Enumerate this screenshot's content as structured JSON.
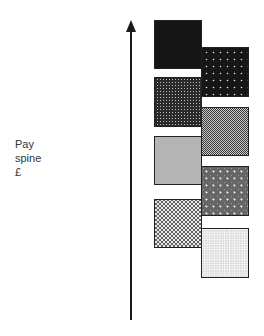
{
  "axis": {
    "label_lines": [
      "Pay",
      "spine",
      "£"
    ],
    "direction": "up",
    "arrow_color": "#1a1a1a"
  },
  "grades": {
    "left_column": [
      {
        "pattern": "solid-black",
        "fill": "#151515"
      },
      {
        "pattern": "dense-grid-dark",
        "fill": "#3a3a3a"
      },
      {
        "pattern": "solid-light-grey",
        "fill": "#b4b4b4"
      },
      {
        "pattern": "diamond-lattice",
        "fill": "#9a9a9a"
      }
    ],
    "right_column": [
      {
        "pattern": "black-with-white-dots",
        "fill": "#1c1c1c"
      },
      {
        "pattern": "checker-medium-grey",
        "fill": "#7a7a7a"
      },
      {
        "pattern": "grey-with-white-crosses",
        "fill": "#6e6e6e"
      },
      {
        "pattern": "fine-light-stipple",
        "fill": "#d8d8d8"
      }
    ]
  }
}
